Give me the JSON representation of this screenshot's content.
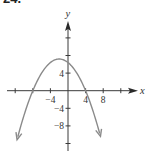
{
  "problem_number": "24.",
  "chart_data": {
    "type": "line",
    "title": "",
    "xlabel": "x",
    "ylabel": "y",
    "function": "y = -0.2(x + 2)^2 + 7.2",
    "vertex": [
      -2,
      7.2
    ],
    "x_intercepts": [
      -8,
      4
    ],
    "y_intercept": 6.4,
    "x_ticks": [
      -12,
      -8,
      -4,
      0,
      4,
      8,
      12
    ],
    "x_tick_labels": [
      {
        "value": -4,
        "text": "−4"
      },
      {
        "value": 4,
        "text": "4"
      },
      {
        "value": 8,
        "text": "8"
      }
    ],
    "y_ticks": [
      -12,
      -8,
      -4,
      0,
      4,
      8,
      12
    ],
    "y_tick_labels": [
      {
        "value": 4,
        "text": "4"
      },
      {
        "value": -4,
        "text": "−4"
      },
      {
        "value": -8,
        "text": "−8"
      }
    ],
    "xlim": [
      -14,
      15
    ],
    "ylim": [
      -13,
      16
    ],
    "grid": false,
    "arrows_on_curve_ends": true,
    "colors": {
      "axes": "#3a3a3a",
      "curve": "#8a8a8a"
    }
  },
  "view": {
    "origin_px": [
      68,
      90.7
    ],
    "px_per_unit": 4.4
  }
}
